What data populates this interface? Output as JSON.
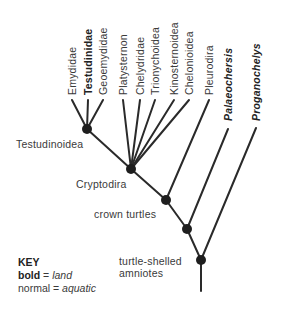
{
  "diagram": {
    "type": "cladogram",
    "colors": {
      "line": "#2a2a2a",
      "node": "#1e1e1e",
      "text": "#3a3a3a"
    },
    "tips": [
      {
        "name": "Emydidae",
        "bold": false,
        "italic": false
      },
      {
        "name": "Testudinidae",
        "bold": true,
        "italic": false
      },
      {
        "name": "Geoemydidae",
        "bold": false,
        "italic": false
      },
      {
        "name": "Platysternon",
        "bold": false,
        "italic": false
      },
      {
        "name": "Chelydridae",
        "bold": false,
        "italic": false
      },
      {
        "name": "Trionychoidea",
        "bold": false,
        "italic": false
      },
      {
        "name": "Kinosternoidea",
        "bold": false,
        "italic": false
      },
      {
        "name": "Chelonioidea",
        "bold": false,
        "italic": false
      },
      {
        "name": "Pleurodira",
        "bold": false,
        "italic": false
      },
      {
        "name": "Palaeochersis",
        "bold": true,
        "italic": true
      },
      {
        "name": "Proganochelys",
        "bold": true,
        "italic": true
      }
    ],
    "nodes": [
      {
        "label": "Testudinoidea"
      },
      {
        "label": "Cryptodira"
      },
      {
        "label": "crown turtles"
      },
      {
        "label": "turtle-shelled",
        "label2": "amniotes"
      }
    ]
  },
  "key": {
    "title": "KEY",
    "bold_word": "bold",
    "bold_meaning": "land",
    "normal_word": "normal",
    "normal_meaning": "aquatic",
    "equals": "="
  }
}
